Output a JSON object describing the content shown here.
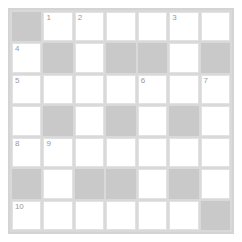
{
  "puzzle": {
    "type": "crossword-grid",
    "title": "Crossword Puzzle Grid",
    "columns": 7,
    "rows": 7,
    "colors": {
      "open_cell": "#ffffff",
      "blocked_cell": "#c9c9c9",
      "grid_line": "#d9d9d9",
      "border": "#d4d4d4",
      "number_text": "#9a9a9a",
      "page_background": "#ffffff"
    },
    "legend": {
      "open_label": "open cell",
      "blocked_label": "blocked cell"
    },
    "counts": {
      "total_cells": 49,
      "open_cells": 36,
      "blocked_cells": 13,
      "numbered_cells": 10
    },
    "clue_numbers": [
      1,
      2,
      3,
      4,
      5,
      6,
      7,
      8,
      9,
      10
    ],
    "cells": [
      [
        {
          "blocked": true,
          "number": ""
        },
        {
          "blocked": false,
          "number": "1"
        },
        {
          "blocked": false,
          "number": "2"
        },
        {
          "blocked": false,
          "number": ""
        },
        {
          "blocked": false,
          "number": ""
        },
        {
          "blocked": false,
          "number": "3"
        },
        {
          "blocked": false,
          "number": ""
        }
      ],
      [
        {
          "blocked": false,
          "number": "4"
        },
        {
          "blocked": true,
          "number": ""
        },
        {
          "blocked": false,
          "number": ""
        },
        {
          "blocked": true,
          "number": ""
        },
        {
          "blocked": true,
          "number": ""
        },
        {
          "blocked": false,
          "number": ""
        },
        {
          "blocked": true,
          "number": ""
        }
      ],
      [
        {
          "blocked": false,
          "number": "5"
        },
        {
          "blocked": false,
          "number": ""
        },
        {
          "blocked": false,
          "number": ""
        },
        {
          "blocked": false,
          "number": ""
        },
        {
          "blocked": false,
          "number": "6"
        },
        {
          "blocked": false,
          "number": ""
        },
        {
          "blocked": false,
          "number": "7"
        }
      ],
      [
        {
          "blocked": false,
          "number": ""
        },
        {
          "blocked": true,
          "number": ""
        },
        {
          "blocked": false,
          "number": ""
        },
        {
          "blocked": true,
          "number": ""
        },
        {
          "blocked": false,
          "number": ""
        },
        {
          "blocked": true,
          "number": ""
        },
        {
          "blocked": false,
          "number": ""
        }
      ],
      [
        {
          "blocked": false,
          "number": "8"
        },
        {
          "blocked": false,
          "number": "9"
        },
        {
          "blocked": false,
          "number": ""
        },
        {
          "blocked": false,
          "number": ""
        },
        {
          "blocked": false,
          "number": ""
        },
        {
          "blocked": false,
          "number": ""
        },
        {
          "blocked": false,
          "number": ""
        }
      ],
      [
        {
          "blocked": true,
          "number": ""
        },
        {
          "blocked": false,
          "number": ""
        },
        {
          "blocked": true,
          "number": ""
        },
        {
          "blocked": true,
          "number": ""
        },
        {
          "blocked": false,
          "number": ""
        },
        {
          "blocked": true,
          "number": ""
        },
        {
          "blocked": false,
          "number": ""
        }
      ],
      [
        {
          "blocked": false,
          "number": "10"
        },
        {
          "blocked": false,
          "number": ""
        },
        {
          "blocked": false,
          "number": ""
        },
        {
          "blocked": false,
          "number": ""
        },
        {
          "blocked": false,
          "number": ""
        },
        {
          "blocked": false,
          "number": ""
        },
        {
          "blocked": true,
          "number": ""
        }
      ]
    ]
  }
}
